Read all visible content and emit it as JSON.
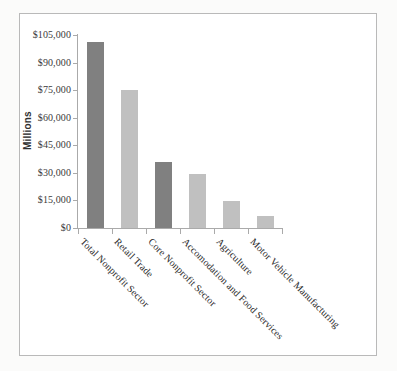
{
  "axis": {
    "y_title": "Millions",
    "y_ticks": [
      "$105,000",
      "$90,000",
      "$75,000",
      "$60,000",
      "$45,000",
      "$30,000",
      "$15,000",
      "$0"
    ]
  },
  "colors": {
    "bar_dark": "#808080",
    "bar_light": "#c0c0c0",
    "axis": "#aaaaaa",
    "frame": "#b9b9b9",
    "page_background": "#fbfbfa"
  },
  "chart_data": {
    "type": "bar",
    "title": "",
    "xlabel": "",
    "ylabel": "Millions",
    "ylim": [
      0,
      105000
    ],
    "ytick_values": [
      0,
      15000,
      30000,
      45000,
      60000,
      75000,
      90000,
      105000
    ],
    "ytick_labels": [
      "$0",
      "$15,000",
      "$30,000",
      "$45,000",
      "$60,000",
      "$75,000",
      "$90,000",
      "$105,000"
    ],
    "grid": false,
    "legend": "none",
    "categories": [
      "Total Nonprofit Sector",
      "Retail Trade",
      "Core Nonprofit Sector",
      "Accomodation and Food Services",
      "Agriculture",
      "Motor Vehicle Manufacturing"
    ],
    "values": [
      101000,
      75000,
      36000,
      29500,
      14500,
      6500
    ],
    "bar_colors": [
      "#808080",
      "#c0c0c0",
      "#808080",
      "#c0c0c0",
      "#c0c0c0",
      "#c0c0c0"
    ]
  }
}
